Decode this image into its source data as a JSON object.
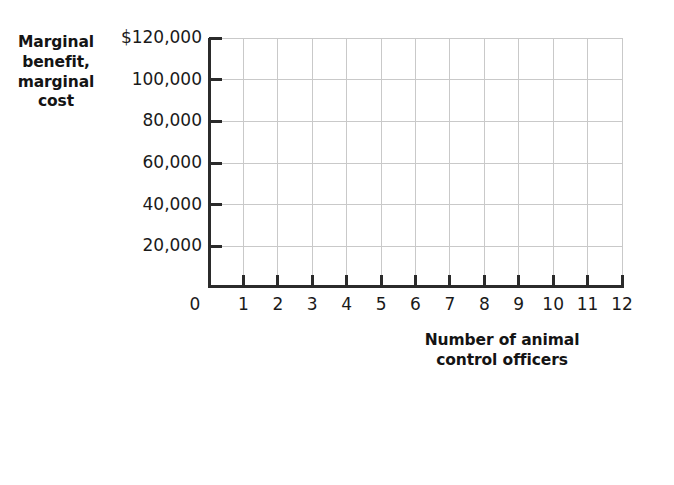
{
  "chart_data": {
    "type": "line",
    "title": "",
    "subtitle": "",
    "xlabel": "Number of animal control officers",
    "ylabel": "Marginal benefit, marginal cost",
    "xlabel_lines": [
      "Number of animal",
      "control officers"
    ],
    "ylabel_lines": [
      "Marginal",
      "benefit,",
      "marginal",
      "cost"
    ],
    "x": [
      0,
      1,
      2,
      3,
      4,
      5,
      6,
      7,
      8,
      9,
      10,
      11,
      12
    ],
    "xtick_labels": [
      "0",
      "1",
      "2",
      "3",
      "4",
      "5",
      "6",
      "7",
      "8",
      "9",
      "10",
      "11",
      "12"
    ],
    "xlim": [
      0,
      12
    ],
    "ylim": [
      0,
      120000
    ],
    "ytick_values": [
      0,
      20000,
      40000,
      60000,
      80000,
      100000,
      120000
    ],
    "ytick_labels": [
      "20,000",
      "40,000",
      "60,000",
      "80,000",
      "100,000",
      "$120,000"
    ],
    "y_origin_label": "0",
    "series": [],
    "values": [],
    "categories": [],
    "grid": true,
    "grid_color": "#c9c9c9",
    "axis_color": "#2b2b2b",
    "background_color": "#ffffff",
    "legend": [],
    "legend_position": "none",
    "annotations": [],
    "note": "Blank graph template with gridlines only; no data series plotted."
  },
  "axis": {
    "y_ticks": [
      {
        "label": "$120,000",
        "value": 120000
      },
      {
        "label": "100,000",
        "value": 100000
      },
      {
        "label": "80,000",
        "value": 80000
      },
      {
        "label": "60,000",
        "value": 60000
      },
      {
        "label": "40,000",
        "value": 40000
      },
      {
        "label": "20,000",
        "value": 20000
      }
    ],
    "y_origin": {
      "label": "0",
      "value": 0
    },
    "x_ticks": [
      {
        "label": "0",
        "value": 0
      },
      {
        "label": "1",
        "value": 1
      },
      {
        "label": "2",
        "value": 2
      },
      {
        "label": "3",
        "value": 3
      },
      {
        "label": "4",
        "value": 4
      },
      {
        "label": "5",
        "value": 5
      },
      {
        "label": "6",
        "value": 6
      },
      {
        "label": "7",
        "value": 7
      },
      {
        "label": "8",
        "value": 8
      },
      {
        "label": "9",
        "value": 9
      },
      {
        "label": "10",
        "value": 10
      },
      {
        "label": "11",
        "value": 11
      },
      {
        "label": "12",
        "value": 12
      }
    ]
  },
  "titles": {
    "y_line_1": "Marginal",
    "y_line_2": "benefit,",
    "y_line_3": "marginal",
    "y_line_4": "cost",
    "x_line_1": "Number of animal",
    "x_line_2": "control officers"
  }
}
